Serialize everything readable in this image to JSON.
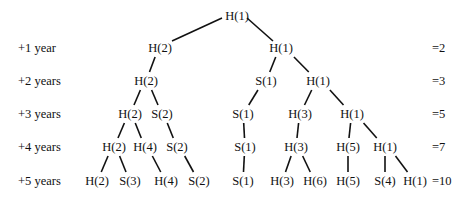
{
  "rows": [
    {
      "label": "",
      "total": "",
      "y": 16
    },
    {
      "label": "+1 year",
      "total": "=2",
      "y": 48
    },
    {
      "label": "+2 years",
      "total": "=3",
      "y": 81
    },
    {
      "label": "+3 years",
      "total": "=5",
      "y": 114
    },
    {
      "label": "+4 years",
      "total": "=7",
      "y": 147
    },
    {
      "label": "+5 years",
      "total": "=10",
      "y": 181
    }
  ],
  "nodes": [
    {
      "id": "n0",
      "text": "H(1)",
      "row": 0,
      "x": 237
    },
    {
      "id": "n1a",
      "text": "H(2)",
      "row": 1,
      "x": 160,
      "parent": "n0"
    },
    {
      "id": "n1b",
      "text": "H(1)",
      "row": 1,
      "x": 281,
      "parent": "n0"
    },
    {
      "id": "n2a",
      "text": "H(2)",
      "row": 2,
      "x": 146,
      "parent": "n1a"
    },
    {
      "id": "n2b",
      "text": "S(1)",
      "row": 2,
      "x": 266,
      "parent": "n1b"
    },
    {
      "id": "n2c",
      "text": "H(1)",
      "row": 2,
      "x": 318,
      "parent": "n1b"
    },
    {
      "id": "n3a",
      "text": "H(2)",
      "row": 3,
      "x": 130,
      "parent": "n2a"
    },
    {
      "id": "n3b",
      "text": "S(2)",
      "row": 3,
      "x": 162,
      "parent": "n2a"
    },
    {
      "id": "n3c",
      "text": "S(1)",
      "row": 3,
      "x": 243,
      "parent": "n2b"
    },
    {
      "id": "n3d",
      "text": "H(3)",
      "row": 3,
      "x": 300,
      "parent": "n2c"
    },
    {
      "id": "n3e",
      "text": "H(1)",
      "row": 3,
      "x": 352,
      "parent": "n2c"
    },
    {
      "id": "n4a",
      "text": "H(2)",
      "row": 4,
      "x": 114,
      "parent": "n3a"
    },
    {
      "id": "n4b",
      "text": "H(4)",
      "row": 4,
      "x": 145,
      "parent": "n3a"
    },
    {
      "id": "n4c",
      "text": "S(2)",
      "row": 4,
      "x": 177,
      "parent": "n3b"
    },
    {
      "id": "n4d",
      "text": "S(1)",
      "row": 4,
      "x": 245,
      "parent": "n3c"
    },
    {
      "id": "n4e",
      "text": "H(3)",
      "row": 4,
      "x": 296,
      "parent": "n3d"
    },
    {
      "id": "n4f",
      "text": "H(5)",
      "row": 4,
      "x": 348,
      "parent": "n3e"
    },
    {
      "id": "n4g",
      "text": "H(1)",
      "row": 4,
      "x": 385,
      "parent": "n3e"
    },
    {
      "id": "n5a",
      "text": "H(2)",
      "row": 5,
      "x": 97,
      "parent": "n4a"
    },
    {
      "id": "n5b",
      "text": "S(3)",
      "row": 5,
      "x": 130,
      "parent": "n4a"
    },
    {
      "id": "n5c",
      "text": "H(4)",
      "row": 5,
      "x": 166,
      "parent": "n4b"
    },
    {
      "id": "n5d",
      "text": "S(2)",
      "row": 5,
      "x": 199,
      "parent": "n4c"
    },
    {
      "id": "n5e",
      "text": "S(1)",
      "row": 5,
      "x": 243,
      "parent": "n4d"
    },
    {
      "id": "n5f",
      "text": "H(3)",
      "row": 5,
      "x": 282,
      "parent": "n4e"
    },
    {
      "id": "n5g",
      "text": "H(6)",
      "row": 5,
      "x": 315,
      "parent": "n4e"
    },
    {
      "id": "n5h",
      "text": "H(5)",
      "row": 5,
      "x": 348,
      "parent": "n4f"
    },
    {
      "id": "n5i",
      "text": "S(4)",
      "row": 5,
      "x": 385,
      "parent": "n4g"
    },
    {
      "id": "n5j",
      "text": "H(1)",
      "row": 5,
      "x": 415,
      "parent": "n4g"
    }
  ]
}
